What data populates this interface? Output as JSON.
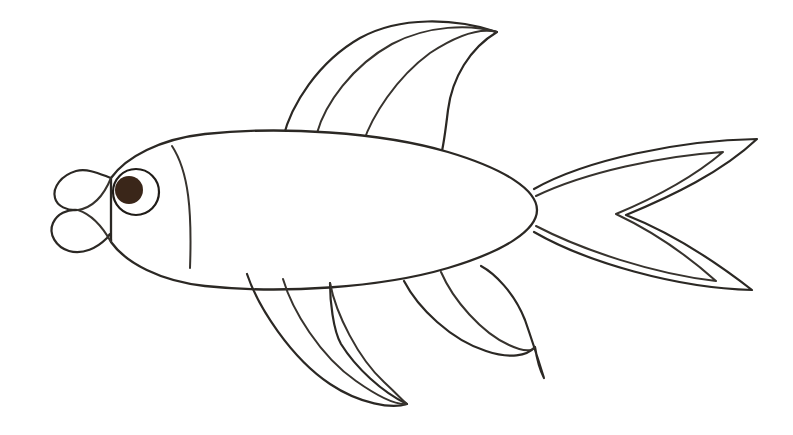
{
  "page": {
    "style": "line-art-coloring-page",
    "width": 793,
    "height": 435
  },
  "colors": {
    "background": "#ffffff",
    "outline": "#2b2824",
    "outline_soft": "#37332e",
    "fill": "#ffffff",
    "pupil": "#3a2619"
  },
  "drawing": {
    "line_width": 2.2,
    "parts": [
      {
        "id": "body",
        "label": "body",
        "shape": "ellipse",
        "cx": 355,
        "cy": 210,
        "rx": 182,
        "ry": 75
      },
      {
        "id": "mouth",
        "label": "mouth",
        "shape": "lips",
        "x": 48,
        "y": 172,
        "width": 62,
        "height": 80
      },
      {
        "id": "gill-line",
        "label": "gill line",
        "shape": "curve",
        "from": [
          172,
          146
        ],
        "to": [
          190,
          268
        ]
      },
      {
        "id": "eye",
        "label": "eye",
        "shape": "circle",
        "cx": 136,
        "cy": 192,
        "r": 23
      },
      {
        "id": "pupil",
        "label": "pupil",
        "shape": "circle",
        "cx": 130,
        "cy": 190,
        "r": 14
      },
      {
        "id": "dorsal-fin",
        "label": "top fin",
        "rays": 2,
        "tip": [
          498,
          32
        ],
        "base_from": [
          283,
          138
        ],
        "base_to": [
          441,
          154
        ]
      },
      {
        "id": "tail-fin",
        "label": "tail fin",
        "lobes": 2,
        "upper_tip": [
          757,
          139
        ],
        "lower_tip": [
          752,
          290
        ],
        "notch": [
          625,
          215
        ]
      },
      {
        "id": "pelvic-fin",
        "label": "bottom front fin",
        "rays": 2,
        "tip": [
          407,
          404
        ],
        "base_from": [
          247,
          274
        ],
        "base_to": [
          330,
          283
        ]
      },
      {
        "id": "anal-fin",
        "label": "bottom back fin",
        "rays": 1,
        "tip": [
          543,
          377
        ],
        "base_from": [
          404,
          281
        ],
        "base_to": [
          481,
          266
        ]
      }
    ]
  },
  "eye": {
    "pupil_color": "#3a2619",
    "sclera_color": "#ffffff"
  }
}
